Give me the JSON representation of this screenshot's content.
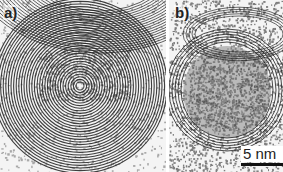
{
  "figure": {
    "panels": [
      {
        "label": "a)",
        "description": "TEM micrograph of large onion-like concentric carbon shells"
      },
      {
        "label": "b)",
        "description": "TEM micrograph of smaller particle with disordered core surrounded by curved graphitic layers"
      }
    ],
    "scale_bar": {
      "label": "5 nm"
    },
    "colors": {
      "dark": "#1e1e1e",
      "background": "#f4f4f4",
      "mid": "#8a8a8a"
    }
  }
}
